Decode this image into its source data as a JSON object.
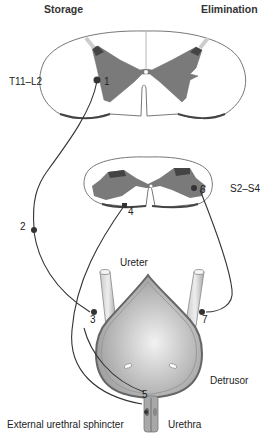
{
  "headers": {
    "left": "Storage",
    "right": "Elimination"
  },
  "spinal_segments": {
    "upper": "T11–L2",
    "lower": "S2–S4"
  },
  "structures": {
    "ureter": "Ureter",
    "detrusor": "Detrusor",
    "external_sphincter": "External urethral sphincter",
    "urethra": "Urethra"
  },
  "markers": [
    "1",
    "2",
    "3",
    "4",
    "5",
    "6",
    "7"
  ],
  "colors": {
    "gray_matter": "#7a7a7a",
    "outline": "#555555",
    "bladder": "#b8b8b8",
    "nerve": "#333333"
  }
}
